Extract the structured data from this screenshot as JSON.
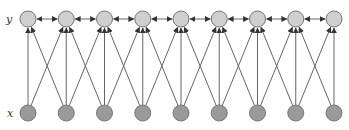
{
  "diagram": {
    "type": "graphical-model",
    "labels": {
      "top_row": "y",
      "bottom_row": "x"
    },
    "node_count_per_row": 9,
    "colors": {
      "y_node_fill": "#cfcfcf",
      "x_node_fill": "#9a9a9a",
      "node_stroke": "#777777",
      "edge": "#666666"
    },
    "edges": {
      "x_to_y": "each x_i -> y_{i-1}, y_i, y_{i+1}",
      "y_to_y": "bidirectional between adjacent y nodes"
    }
  }
}
